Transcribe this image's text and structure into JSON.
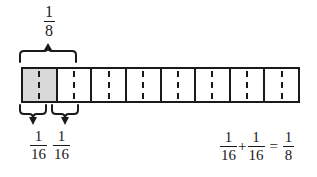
{
  "diagram": {
    "type": "fraction-bar-model",
    "background_color": "#ffffff",
    "line_color": "#1a1a1a",
    "shaded_color": "#d9d9d9",
    "bar": {
      "total_cells": 8,
      "halves_per_cell": 2,
      "total_halves": 16,
      "shaded_cells": 1,
      "cell_divider_style": "solid",
      "half_divider_style": "dashed"
    },
    "top_label": {
      "numerator": "1",
      "denominator": "8",
      "spans_cells": 1
    },
    "bottom_labels": [
      {
        "numerator": "1",
        "denominator": "16"
      },
      {
        "numerator": "1",
        "denominator": "16"
      }
    ],
    "equation": {
      "term1": {
        "numerator": "1",
        "denominator": "16"
      },
      "operator1": "+",
      "term2": {
        "numerator": "1",
        "denominator": "16"
      },
      "operator2": "=",
      "result": {
        "numerator": "1",
        "denominator": "8"
      }
    }
  }
}
